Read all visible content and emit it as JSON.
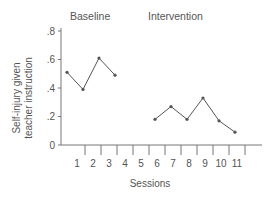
{
  "chart_data": {
    "type": "line",
    "title": "",
    "xlabel": "Sessions",
    "ylabel": "Self-injury given teacher instruction",
    "ylabel_lines": [
      "Self-injury given",
      "teacher instruction"
    ],
    "ylim": [
      0,
      0.8
    ],
    "yticks": [
      0,
      0.2,
      0.4,
      0.6,
      0.8
    ],
    "ytick_labels": [
      "0",
      ".2",
      ".4",
      ".6",
      ".8"
    ],
    "xticks": [
      1,
      2,
      3,
      4,
      5,
      6,
      7,
      8,
      9,
      10,
      11
    ],
    "xtick_labels": [
      "1",
      "2",
      "3",
      "4",
      "5",
      "6",
      "7",
      "8",
      "9",
      "10",
      "11"
    ],
    "grid": false,
    "phases": [
      {
        "label": "Baseline",
        "sessions": [
          1,
          2,
          3,
          4
        ]
      },
      {
        "label": "Intervention",
        "sessions": [
          5,
          6,
          7,
          8,
          9,
          10,
          11
        ]
      }
    ],
    "series": [
      {
        "name": "Baseline",
        "x": [
          1,
          2,
          3,
          4
        ],
        "values": [
          0.51,
          0.39,
          0.61,
          0.49
        ]
      },
      {
        "name": "Intervention",
        "x": [
          6,
          7,
          8,
          9,
          10,
          11
        ],
        "values": [
          0.18,
          0.27,
          0.18,
          0.33,
          0.17,
          0.09
        ]
      }
    ]
  },
  "colors": {
    "line": "#555555",
    "axis": "#777777",
    "text": "#555555"
  }
}
